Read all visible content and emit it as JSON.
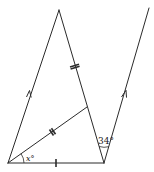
{
  "diagram": {
    "type": "geometry",
    "points": {
      "A_bottom_left": [
        8,
        163
      ],
      "B_bottom_right": [
        104,
        163
      ],
      "C_apex": [
        59,
        10
      ],
      "D_on_BC": [
        87,
        107
      ],
      "E_parallel_top": [
        149,
        8
      ]
    },
    "segments": [
      {
        "from": "A_bottom_left",
        "to": "C_apex",
        "marker": "parallel-arrow"
      },
      {
        "from": "C_apex",
        "to": "B_bottom_right",
        "marker": "none"
      },
      {
        "from": "A_bottom_left",
        "to": "B_bottom_right",
        "marker": "single-tick"
      },
      {
        "from": "A_bottom_left",
        "to": "D_on_BC",
        "marker": "double-tick"
      },
      {
        "from": "C_apex",
        "to": "D_on_BC",
        "marker": "double-tick"
      },
      {
        "from": "B_bottom_right",
        "to": "E_parallel_top",
        "marker": "parallel-arrow"
      }
    ],
    "angles": {
      "x_label": "x°",
      "angle_34_label": "34°"
    },
    "colors": {
      "line": "#2b2b2b",
      "background": "#ffffff"
    }
  }
}
